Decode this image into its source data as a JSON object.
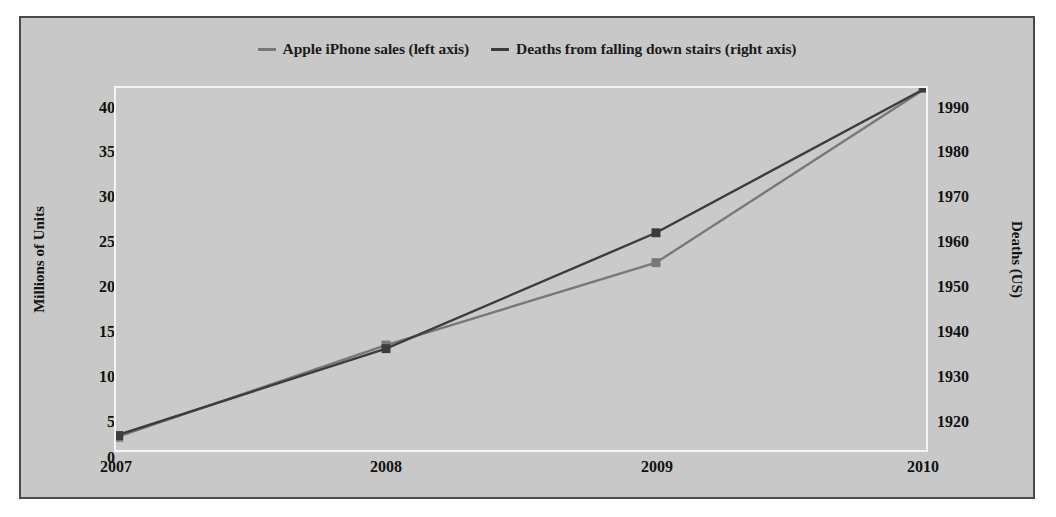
{
  "legend": {
    "entries": [
      {
        "label": "Apple iPhone sales (left axis)",
        "color": "#787878",
        "name": "legend-iphone"
      },
      {
        "label": "Deaths from falling down stairs (right axis)",
        "color": "#3c3c3c",
        "name": "legend-deaths"
      }
    ]
  },
  "axes": {
    "left_title": "Millions of Units",
    "right_title": "Deaths (US)",
    "left_ticks": [
      "40",
      "35",
      "30",
      "25",
      "20",
      "15",
      "10",
      "5",
      "0"
    ],
    "right_ticks": [
      "1990",
      "1980",
      "1970",
      "1960",
      "1950",
      "1940",
      "1930",
      "1920"
    ],
    "x_ticks": [
      "2007",
      "2008",
      "2009",
      "2010"
    ]
  },
  "colors": {
    "frame_background": "#c8c8c8",
    "frame_border": "#4a4a4a",
    "plot_background": "#cacaca",
    "plot_border": "#f4f4f4",
    "series_iphone": "#787878",
    "series_deaths": "#3c3c3c",
    "text": "#111111"
  },
  "chart_data": {
    "type": "line",
    "title": "",
    "subtitle": "",
    "xlabel": "",
    "ylabel": "Millions of Units",
    "y2label": "Deaths (US)",
    "categories": [
      "2007",
      "2008",
      "2009",
      "2010"
    ],
    "x": [
      2007,
      2008,
      2009,
      2010
    ],
    "ylim": [
      0,
      40
    ],
    "y2lim": [
      1915,
      1990
    ],
    "yticks": [
      0,
      5,
      10,
      15,
      20,
      25,
      30,
      35,
      40
    ],
    "y2ticks": [
      1920,
      1930,
      1940,
      1950,
      1960,
      1970,
      1980,
      1990
    ],
    "grid": false,
    "legend_position": "top",
    "markers": "square",
    "series": [
      {
        "name": "Apple iPhone sales (left axis)",
        "axis": "left",
        "units": "Millions of Units",
        "color": "#787878",
        "values": [
          1.4,
          11.6,
          20.7,
          40.0
        ]
      },
      {
        "name": "Deaths from falling down stairs (right axis)",
        "axis": "right",
        "units": "Deaths (US)",
        "color": "#3c3c3c",
        "values": [
          1918,
          1936,
          1960,
          1990
        ]
      }
    ]
  }
}
